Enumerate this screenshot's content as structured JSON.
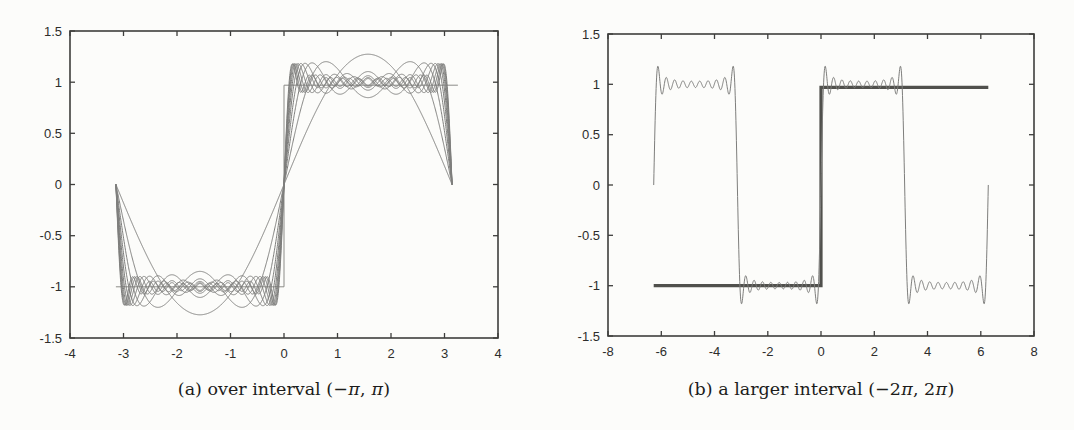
{
  "figure": {
    "panels": [
      {
        "id": "a",
        "caption": {
          "prefix": "(a) over interval",
          "math": "(−π, π)"
        }
      },
      {
        "id": "b",
        "caption": {
          "prefix": "(b) a larger interval",
          "math": "(−2π, 2π)"
        }
      }
    ]
  },
  "chart_data": [
    {
      "type": "line",
      "panel": "a",
      "title": "",
      "xlabel": "",
      "ylabel": "",
      "caption": "(a) over interval (−π, π)",
      "xlim": [
        -4,
        4
      ],
      "ylim": [
        -1.5,
        1.5
      ],
      "xticks": [
        -4,
        -3,
        -2,
        -1,
        0,
        1,
        2,
        3,
        4
      ],
      "yticks": [
        -1.5,
        -1,
        -0.5,
        0,
        0.5,
        1,
        1.5
      ],
      "grid": false,
      "legend": "none",
      "description": "Fourier partial sums S_N(x) = (4/pi) * sum over odd k<=N of sin(kx)/k, for N = 1,3,...,19, plotted over one period (-pi,pi); all sums are 0 at x = 0 and x = ±pi; S_1 peaks at ±1.27; higher sums overshoot to ±1.18 (Gibbs phenomenon); thin square-wave reference at -1 for x<0 and +0.97 for x>0",
      "series": [
        {
          "name": "square-wave-reference",
          "kind": "square_wave",
          "style": "ref",
          "x_range": [
            -3.1416,
            3.25
          ],
          "y_neg": -1.0,
          "y_pos": 0.97
        },
        {
          "name": "fourier-partial-sums",
          "kind": "fourier_partial_sum",
          "style": "curve",
          "harmonics": [
            1,
            3,
            5,
            7,
            9,
            11,
            13,
            15,
            17,
            19
          ],
          "coefficient": "4/pi",
          "x_range": [
            -3.1416,
            3.1416
          ]
        }
      ]
    },
    {
      "type": "line",
      "panel": "b",
      "title": "",
      "xlabel": "",
      "ylabel": "",
      "caption": "(b) a larger interval (−2π, 2π)",
      "xlim": [
        -8,
        8
      ],
      "ylim": [
        -1.5,
        1.5
      ],
      "xticks": [
        -8,
        -6,
        -4,
        -2,
        0,
        2,
        4,
        6,
        8
      ],
      "yticks": [
        -1.5,
        -1,
        -0.5,
        0,
        0.5,
        1,
        1.5
      ],
      "grid": false,
      "legend": "none",
      "description": "Thick square wave sign(x) drawn over (-2pi,2pi): -1 on (-2pi,0), +0.97 on (0,2pi), with jump at x=0; thin periodic Fourier partial sum S_19(x) = (4/pi) * sum over odd k<=19 of sin(kx)/k over (-2pi,2pi), oscillating about ±1 with Gibbs overshoot ≈ ±1.18 near x = 0, ±pi, ±2pi",
      "series": [
        {
          "name": "square-wave",
          "kind": "square_wave",
          "style": "sq",
          "x_range": [
            -6.2832,
            6.2832
          ],
          "y_neg": -1.0,
          "y_pos": 0.97
        },
        {
          "name": "fourier-partial-sum-N19",
          "kind": "fourier_partial_sum",
          "style": "curve",
          "harmonics": [
            19
          ],
          "coefficient": "4/pi",
          "x_range": [
            -6.2832,
            6.2832
          ]
        }
      ]
    }
  ]
}
